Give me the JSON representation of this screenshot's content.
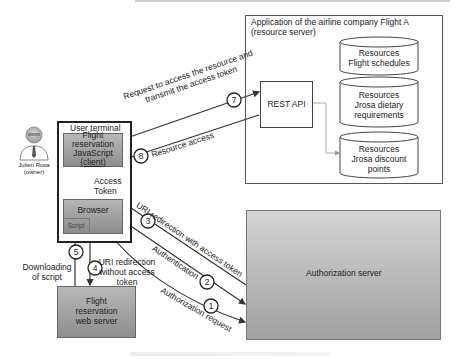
{
  "diagram": {
    "actor": {
      "name": "Julien Rosa",
      "role": "(owner)"
    },
    "user_terminal": {
      "title": "User terminal",
      "client": {
        "line1": "Flight",
        "line2": "reservation",
        "line3": "JavaScript",
        "line4": "(client)"
      },
      "browser": "Browser",
      "script": "Script"
    },
    "web_server": {
      "line1": "Flight",
      "line2": "reservation",
      "line3": "web server"
    },
    "resource_server": {
      "title_line1": "Application of the airline company Flight A",
      "title_line2": "(resource server)",
      "rest_api": "REST API",
      "resources": [
        {
          "line1": "Resources",
          "line2": "Flight schedules",
          "line3": ""
        },
        {
          "line1": "Resources",
          "line2": "Jrosa dietary",
          "line3": "requirements"
        },
        {
          "line1": "Resources",
          "line2": "Jrosa discount",
          "line3": "points"
        }
      ]
    },
    "authorization_server": "Authorization server",
    "steps": [
      {
        "num": "1",
        "label": "Authorization request"
      },
      {
        "num": "2",
        "label": "Authentication"
      },
      {
        "num": "3",
        "label": "URI redirection with access token"
      },
      {
        "num": "4",
        "label_line1": "URI redirection",
        "label_line2": "without access",
        "label_line3": "token"
      },
      {
        "num": "5",
        "label_line1": "Downloading",
        "label_line2": "of script"
      },
      {
        "num": "6",
        "label_line1": "Access",
        "label_line2": "Token"
      },
      {
        "num": "7",
        "label_line1": "Request to access the resource and",
        "label_line2": "transmit the access token"
      },
      {
        "num": "8",
        "label": "Resource access"
      }
    ]
  }
}
